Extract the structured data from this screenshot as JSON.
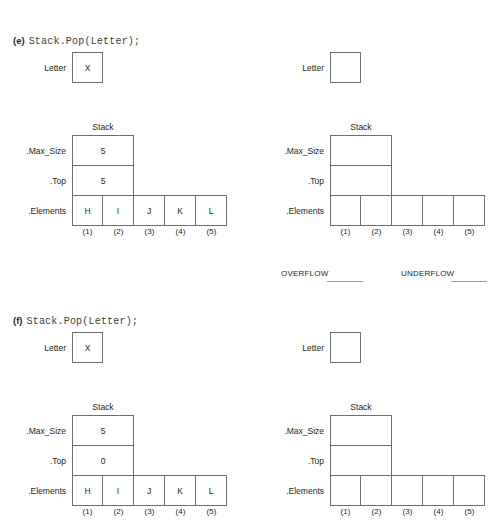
{
  "page": {
    "width": 500,
    "height": 528,
    "background": "#ffffff",
    "ink": "#231f20",
    "box_stroke": "#6d6e70"
  },
  "sections": [
    {
      "id": "section-e",
      "marker": "(e)",
      "code": "Stack.Pop(Letter);",
      "before": {
        "letter": {
          "label": "Letter",
          "value": "X"
        },
        "stack": {
          "title": "Stack",
          "max_size_label": ".Max_Size",
          "max_size_value": "5",
          "top_label": ".Top",
          "top_value": "5",
          "elements_label": ".Elements",
          "elements": [
            "H",
            "I",
            "J",
            "K",
            "L"
          ],
          "indices": [
            "(1)",
            "(2)",
            "(3)",
            "(4)",
            "(5)"
          ]
        }
      },
      "after": {
        "letter": {
          "label": "Letter",
          "value": ""
        },
        "stack": {
          "title": "Stack",
          "max_size_label": ".Max_Size",
          "max_size_value": "",
          "top_label": ".Top",
          "top_value": "",
          "elements_label": ".Elements",
          "elements": [
            "",
            "",
            "",
            "",
            ""
          ],
          "indices": [
            "(1)",
            "(2)",
            "(3)",
            "(4)",
            "(5)"
          ]
        }
      },
      "flags": {
        "overflow_label": "OVERFLOW",
        "underflow_label": "UNDERFLOW"
      }
    },
    {
      "id": "section-f",
      "marker": "(f)",
      "code": "Stack.Pop(Letter);",
      "before": {
        "letter": {
          "label": "Letter",
          "value": "X"
        },
        "stack": {
          "title": "Stack",
          "max_size_label": ".Max_Size",
          "max_size_value": "5",
          "top_label": ".Top",
          "top_value": "0",
          "elements_label": ".Elements",
          "elements": [
            "H",
            "I",
            "J",
            "K",
            "L"
          ],
          "indices": [
            "(1)",
            "(2)",
            "(3)",
            "(4)",
            "(5)"
          ]
        }
      },
      "after": {
        "letter": {
          "label": "Letter",
          "value": ""
        },
        "stack": {
          "title": "Stack",
          "max_size_label": ".Max_Size",
          "max_size_value": "",
          "top_label": ".Top",
          "top_value": "",
          "elements_label": ".Elements",
          "elements": [
            "",
            "",
            "",
            "",
            ""
          ],
          "indices": [
            "(1)",
            "(2)",
            "(3)",
            "(4)",
            "(5)"
          ]
        }
      },
      "flags": null
    }
  ]
}
